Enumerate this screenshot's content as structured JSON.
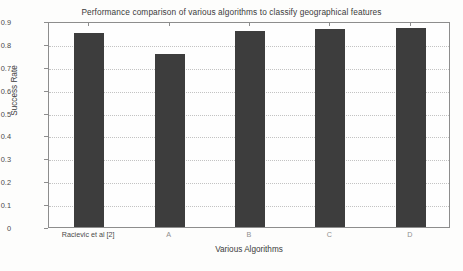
{
  "chart_data": {
    "type": "bar",
    "title": "Performance comparison of various algorithms to classify geographical features",
    "xlabel": "Various Algorithms",
    "ylabel": "Success Rate",
    "categories": [
      "Racievic et al [2]",
      "A",
      "B",
      "C",
      "D"
    ],
    "values": [
      0.848,
      0.757,
      0.855,
      0.863,
      0.868
    ],
    "ylim": [
      0,
      0.9
    ],
    "ytick_labels": [
      "0",
      "0.1",
      "0.2",
      "0.3",
      "0.4",
      "0.5",
      "0.6",
      "0.7",
      "0.8",
      "0.9"
    ],
    "ytick_values": [
      0,
      0.1,
      0.2,
      0.3,
      0.4,
      0.5,
      0.6,
      0.7,
      0.8,
      0.9
    ],
    "grid": true,
    "legend": null,
    "series": [
      {
        "name": "Success Rate",
        "values": [
          0.848,
          0.757,
          0.855,
          0.863,
          0.868
        ]
      }
    ],
    "bar_color": "#3d3d3d",
    "frame_color": "#8d8d8d",
    "background_color": "#fdfdfc"
  }
}
